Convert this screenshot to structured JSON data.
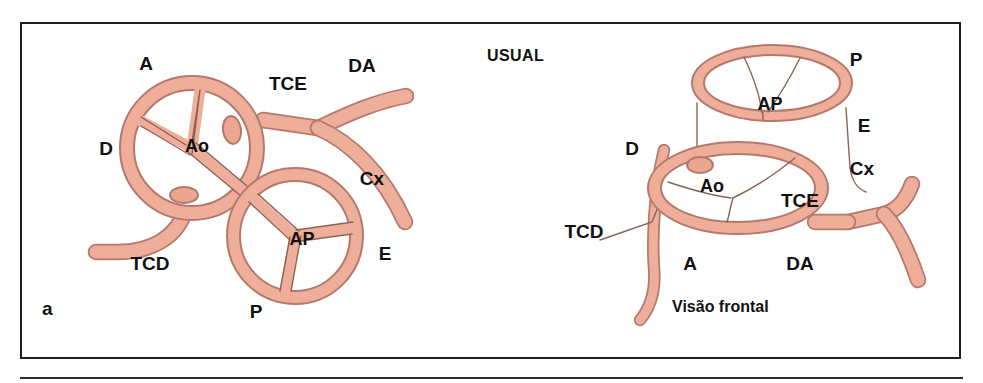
{
  "figure": {
    "panel_label": "a",
    "title_label": "USUAL",
    "caption_right": "Visão frontal",
    "colors": {
      "vessel_fill": "#efae99",
      "vessel_stroke": "#b4796c",
      "frame": "#1d1f24",
      "text": "#111111",
      "background": "#ffffff"
    }
  },
  "left_diagram": {
    "name": "superior-axial-view",
    "labels": [
      {
        "id": "a-anterior",
        "text": "A",
        "x": 146,
        "y": 70
      },
      {
        "id": "tce",
        "text": "TCE",
        "x": 288,
        "y": 90
      },
      {
        "id": "da",
        "text": "DA",
        "x": 362,
        "y": 72
      },
      {
        "id": "d-right",
        "text": "D",
        "x": 106,
        "y": 155
      },
      {
        "id": "ao",
        "text": "Ao",
        "x": 197,
        "y": 152
      },
      {
        "id": "cx",
        "text": "Cx",
        "x": 372,
        "y": 185
      },
      {
        "id": "ap",
        "text": "AP",
        "x": 302,
        "y": 245
      },
      {
        "id": "e-left",
        "text": "E",
        "x": 385,
        "y": 260
      },
      {
        "id": "tcd",
        "text": "TCD",
        "x": 150,
        "y": 270
      },
      {
        "id": "p-posterior",
        "text": "P",
        "x": 256,
        "y": 318
      }
    ]
  },
  "right_diagram": {
    "name": "frontal-view",
    "labels": [
      {
        "id": "p-pulmonary",
        "text": "P",
        "x": 856,
        "y": 66
      },
      {
        "id": "ap",
        "text": "AP",
        "x": 770,
        "y": 110
      },
      {
        "id": "e-left",
        "text": "E",
        "x": 864,
        "y": 132
      },
      {
        "id": "d-right",
        "text": "D",
        "x": 632,
        "y": 155
      },
      {
        "id": "cx",
        "text": "Cx",
        "x": 862,
        "y": 175
      },
      {
        "id": "ao",
        "text": "Ao",
        "x": 712,
        "y": 192
      },
      {
        "id": "tce",
        "text": "TCE",
        "x": 800,
        "y": 207
      },
      {
        "id": "tcd",
        "text": "TCD",
        "x": 584,
        "y": 238
      },
      {
        "id": "a-anterior",
        "text": "A",
        "x": 690,
        "y": 270
      },
      {
        "id": "da",
        "text": "DA",
        "x": 800,
        "y": 270
      }
    ]
  },
  "legend_terms": {
    "Ao": "Aorta",
    "AP": "Artéria pulmonar",
    "TCE": "Tronco coronário esquerdo",
    "TCD": "Tronco coronário direito",
    "DA": "Descendente anterior",
    "Cx": "Circunflexa",
    "A": "Anterior",
    "P": "Posterior",
    "D": "Direita",
    "E": "Esquerda"
  }
}
